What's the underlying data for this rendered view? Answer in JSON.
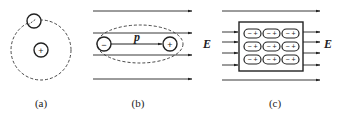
{
  "figure": {
    "panels": [
      {
        "id": "a",
        "caption": "(a)",
        "description": "Atom without field: electron orbiting nucleus",
        "nucleus_sign": "+",
        "electron_sign": "−"
      },
      {
        "id": "b",
        "caption": "(b)",
        "description": "Polarized atom in electric field forming dipole",
        "negative_sign": "−",
        "positive_sign": "+",
        "dipole_label": "p",
        "field_label": "E"
      },
      {
        "id": "c",
        "caption": "(c)",
        "description": "Dielectric slab with aligned dipoles in field",
        "dipole_rows": 3,
        "dipole_cols": 3,
        "dipole_text": "− +",
        "field_label": "E"
      }
    ]
  },
  "colors": {
    "stroke": "#222222",
    "background": "#ffffff"
  }
}
